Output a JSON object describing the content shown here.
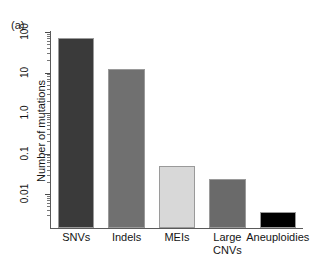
{
  "figure": {
    "panel_label": "(a)",
    "background": "#ffffff"
  },
  "chart_data": {
    "type": "bar",
    "title": "",
    "subtitle": "",
    "panel": "(a)",
    "categories": [
      "SNVs",
      "Indels",
      "MEIs",
      "Large CNVs",
      "Aneuploidies"
    ],
    "category_lines": [
      [
        "SNVs"
      ],
      [
        "Indels"
      ],
      [
        "MEIs"
      ],
      [
        "Large",
        "CNVs"
      ],
      [
        "Aneuploidies"
      ]
    ],
    "values": [
      70,
      12,
      0.05,
      0.024,
      0.0036
    ],
    "xlabel": "",
    "ylabel": "Number of mutations",
    "yscale": "log",
    "ylim": [
      0.0025,
      130
    ],
    "ytick_labels": [
      "100",
      "10",
      "1.0",
      "0.1",
      "0.01"
    ],
    "ytick_values": [
      100,
      10,
      1.0,
      0.1,
      0.01
    ],
    "minor_ticks": true,
    "grid": false,
    "legend": "none",
    "bar_colors": [
      "#3a3a3a",
      "#707070",
      "#d8d8d8",
      "#6a6a6a",
      "#000000"
    ],
    "bar_edge_color": "#9a9a9a",
    "axis_color": "#5a5a5a"
  },
  "axes": {
    "y_title": "Number of mutations",
    "y_ticks": [
      {
        "label": "100",
        "value": 100
      },
      {
        "label": "10",
        "value": 10
      },
      {
        "label": "1.0",
        "value": 1.0
      },
      {
        "label": "0.1",
        "value": 0.1
      },
      {
        "label": "0.01",
        "value": 0.01
      }
    ]
  },
  "bars": [
    {
      "label": "SNVs",
      "value": 70,
      "color": "#3a3a3a"
    },
    {
      "label": "Indels",
      "value": 12,
      "color": "#707070"
    },
    {
      "label": "MEIs",
      "value": 0.05,
      "color": "#d8d8d8"
    },
    {
      "label": "Large CNVs",
      "value": 0.024,
      "color": "#6a6a6a"
    },
    {
      "label": "Aneuploidies",
      "value": 0.0036,
      "color": "#000000"
    }
  ],
  "x_labels": [
    {
      "line1": "SNVs",
      "line2": ""
    },
    {
      "line1": "Indels",
      "line2": ""
    },
    {
      "line1": "MEIs",
      "line2": ""
    },
    {
      "line1": "Large",
      "line2": "CNVs"
    },
    {
      "line1": "Aneuploidies",
      "line2": ""
    }
  ]
}
